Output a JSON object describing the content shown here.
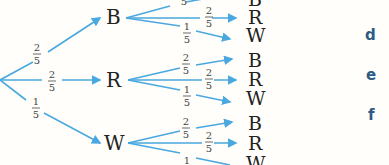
{
  "diagram": {
    "type": "probability-tree",
    "first_level": [
      {
        "outcome": "B",
        "probability": {
          "num": "2",
          "den": "5"
        }
      },
      {
        "outcome": "R",
        "probability": {
          "num": "2",
          "den": "5"
        }
      },
      {
        "outcome": "W",
        "probability": {
          "num": "1",
          "den": "5"
        }
      }
    ],
    "second_level": {
      "B": [
        {
          "outcome": "B",
          "probability": {
            "num": "2",
            "den": "5"
          }
        },
        {
          "outcome": "R",
          "probability": {
            "num": "2",
            "den": "5"
          }
        },
        {
          "outcome": "W",
          "probability": {
            "num": "1",
            "den": "5"
          }
        }
      ],
      "R": [
        {
          "outcome": "B",
          "probability": {
            "num": "2",
            "den": "5"
          }
        },
        {
          "outcome": "R",
          "probability": {
            "num": "2",
            "den": "5"
          }
        },
        {
          "outcome": "W",
          "probability": {
            "num": "1",
            "den": "5"
          }
        }
      ],
      "W": [
        {
          "outcome": "B",
          "probability": {
            "num": "2",
            "den": "5"
          }
        },
        {
          "outcome": "R",
          "probability": {
            "num": "2",
            "den": "5"
          }
        },
        {
          "outcome": "W",
          "probability": {
            "num": "1",
            "den": "5"
          }
        }
      ]
    },
    "colors": {
      "branch": "#4aa8e0",
      "label": "#2d5b84"
    }
  },
  "side_labels": [
    "d",
    "e",
    "f"
  ]
}
